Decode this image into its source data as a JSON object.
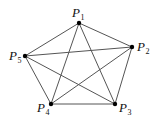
{
  "diagram": {
    "type": "complete-graph",
    "colors": {
      "edge": "#555555",
      "vertex": "#000000",
      "label": "#111111"
    },
    "vertices": [
      {
        "id": "P1",
        "base": "P",
        "sub": "1",
        "x": 79,
        "y": 23,
        "label_x": 72,
        "label_y": 17
      },
      {
        "id": "P2",
        "base": "P",
        "sub": "2",
        "x": 132,
        "y": 47,
        "label_x": 137,
        "label_y": 51
      },
      {
        "id": "P3",
        "base": "P",
        "sub": "3",
        "x": 115,
        "y": 104,
        "label_x": 119,
        "label_y": 112
      },
      {
        "id": "P4",
        "base": "P",
        "sub": "4",
        "x": 51,
        "y": 104,
        "label_x": 37,
        "label_y": 112
      },
      {
        "id": "P5",
        "base": "P",
        "sub": "5",
        "x": 25,
        "y": 56,
        "label_x": 9,
        "label_y": 60
      }
    ],
    "edges": [
      [
        "P1",
        "P2"
      ],
      [
        "P1",
        "P3"
      ],
      [
        "P1",
        "P4"
      ],
      [
        "P1",
        "P5"
      ],
      [
        "P2",
        "P3"
      ],
      [
        "P2",
        "P4"
      ],
      [
        "P2",
        "P5"
      ],
      [
        "P3",
        "P4"
      ],
      [
        "P3",
        "P5"
      ],
      [
        "P4",
        "P5"
      ]
    ]
  }
}
